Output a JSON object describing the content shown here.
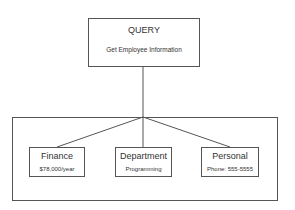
{
  "query": {
    "title": "QUERY",
    "subtitle": "Get Employee Information"
  },
  "children": [
    {
      "title": "Finance",
      "detail": "$78,000/year"
    },
    {
      "title": "Department",
      "detail": "Programming"
    },
    {
      "title": "Personal",
      "detail": "Phone: 555-5555"
    }
  ]
}
